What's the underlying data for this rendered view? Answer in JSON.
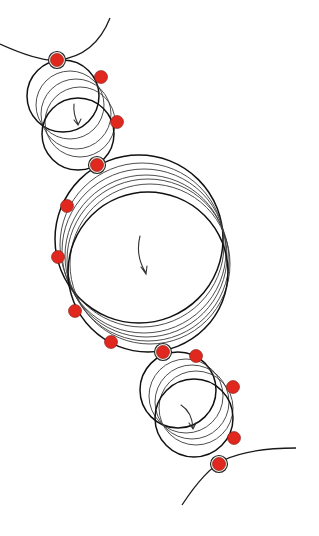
{
  "diagram": {
    "colors": {
      "background": "#ffffff",
      "line": "#1a1a1a",
      "contact_point": "#e0281f"
    },
    "wheels": [
      {
        "name": "small-wheel-top",
        "rotation": "clockwise",
        "ghost_count": 4
      },
      {
        "name": "large-wheel-middle",
        "rotation": "clockwise",
        "ghost_count": 6
      },
      {
        "name": "small-wheel-bottom",
        "rotation": "clockwise",
        "ghost_count": 4
      }
    ],
    "contact_points_count": 13
  }
}
